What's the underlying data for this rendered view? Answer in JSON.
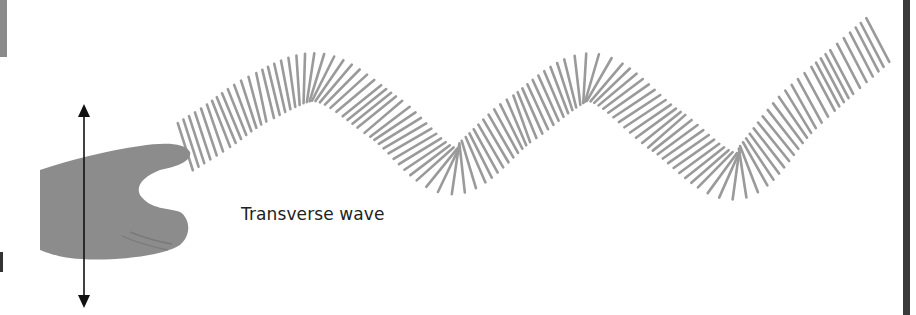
{
  "figure": {
    "caption": "Transverse wave",
    "colors": {
      "spring": "#9a9a9a",
      "hand": "#8c8c8c",
      "arrow": "#111111",
      "caption": "#222222",
      "right_border": "#3a3a3a"
    },
    "arrow": {
      "x": 84,
      "top_y": 106,
      "bottom_y": 306,
      "direction": "up-and-down"
    },
    "spring_path": [
      [
        180,
        150
      ],
      [
        215,
        128
      ],
      [
        260,
        98
      ],
      [
        320,
        78
      ],
      [
        385,
        118
      ],
      [
        452,
        170
      ],
      [
        520,
        120
      ],
      [
        592,
        78
      ],
      [
        665,
        130
      ],
      [
        736,
        175
      ],
      [
        800,
        110
      ],
      [
        880,
        38
      ]
    ]
  }
}
